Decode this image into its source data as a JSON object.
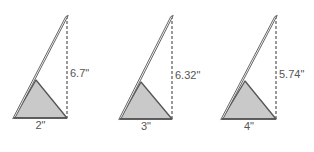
{
  "figures": [
    {
      "height_label": "6.7\"",
      "base_label": "2\"",
      "height_in": 6.7,
      "base_in": 2
    },
    {
      "height_label": "6.32\"",
      "base_label": "3\"",
      "height_in": 6.32,
      "base_in": 3
    },
    {
      "height_label": "5.74\"",
      "base_label": "4\"",
      "height_in": 5.74,
      "base_in": 4
    }
  ],
  "colors": {
    "stroke": "#555555",
    "fill": "#c9c9c9",
    "pole_fill": "#ffffff",
    "dash": "#555555"
  }
}
